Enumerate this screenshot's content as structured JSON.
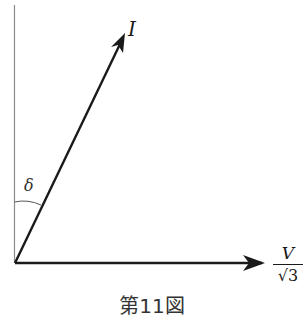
{
  "diagram": {
    "type": "phasor diagram",
    "vectors": {
      "current": {
        "label": "I"
      },
      "voltage": {
        "numerator": "V",
        "denominator": "√3"
      }
    },
    "angle": {
      "label": "δ",
      "between": [
        "vertical axis",
        "I"
      ]
    },
    "caption": "第11図"
  },
  "colors": {
    "line": "#1a1a1a",
    "axis": "#9a9a9a",
    "background": "#ffffff"
  }
}
